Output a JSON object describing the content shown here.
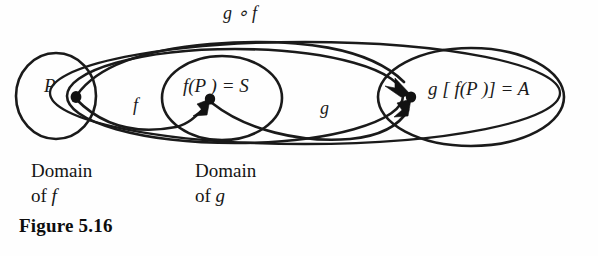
{
  "figure": {
    "caption": "Figure 5.16",
    "background_color": "#fefefe",
    "ink_color": "#1a1a1a"
  },
  "labels": {
    "domain_point": "P",
    "image_point": "f(P ) = S",
    "composite_image": "g [ f(P )] = A",
    "map_f": "f",
    "map_g": "g",
    "composite_map": "g ∘ f"
  },
  "captions": {
    "domain_of_f": {
      "line1": "Domain",
      "line2_prefix": "of ",
      "line2_symbol": "f"
    },
    "domain_of_g": {
      "line1": "Domain",
      "line2_prefix": "of ",
      "line2_symbol": "g"
    }
  },
  "diagram": {
    "type": "set-mapping-diagram",
    "sets": [
      {
        "name": "domain-of-f",
        "shape": "circle",
        "cx": 56,
        "cy": 96,
        "rx": 40,
        "ry": 42
      },
      {
        "name": "domain-of-g",
        "shape": "ellipse",
        "cx": 235,
        "cy": 96,
        "rx": 168,
        "ry": 47
      },
      {
        "name": "image-set-S",
        "shape": "ellipse",
        "cx": 222,
        "cy": 98,
        "rx": 60,
        "ry": 42
      },
      {
        "name": "codomain-A",
        "shape": "ellipse",
        "cx": 471,
        "cy": 97,
        "rx": 93,
        "ry": 49
      },
      {
        "name": "composite-region",
        "shape": "ellipse-outer",
        "cx": 305,
        "cy": 93,
        "rx": 255,
        "ry": 52
      }
    ],
    "points": [
      {
        "name": "point-P",
        "x": 76,
        "y": 97
      },
      {
        "name": "point-S",
        "x": 210,
        "y": 99
      },
      {
        "name": "point-A",
        "x": 411,
        "y": 97
      }
    ],
    "arrows": [
      {
        "name": "arrow-f",
        "from": "point-P",
        "to": "point-S",
        "label": "f"
      },
      {
        "name": "arrow-g",
        "from": "point-S",
        "to": "point-A",
        "label": "g"
      },
      {
        "name": "arrow-g-of-f",
        "from": "point-P",
        "to": "point-A",
        "label": "g ∘ f"
      }
    ]
  }
}
